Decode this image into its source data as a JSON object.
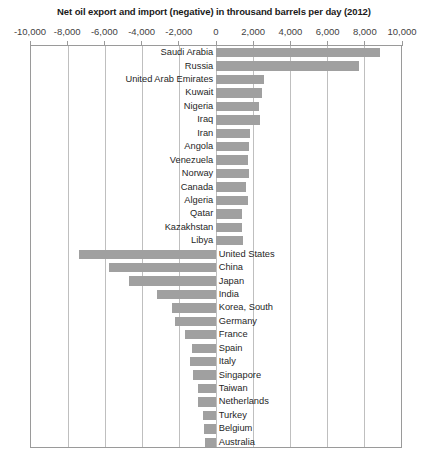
{
  "chart_data": {
    "type": "bar",
    "orientation": "horizontal",
    "title": "Net oil export and import (negative) in throusand barrels per day (2012)",
    "xlabel": "",
    "ylabel": "",
    "xlim": [
      -10000,
      10000
    ],
    "xticks": [
      -10000,
      -8000,
      -6000,
      -4000,
      -2000,
      0,
      2000,
      4000,
      6000,
      8000,
      10000
    ],
    "xticklabels": [
      "-10,000",
      "-8,000",
      "-6,000",
      "-4,000",
      "-2,000",
      "0",
      "2,000",
      "4,000",
      "6,000",
      "8,000",
      "10,000"
    ],
    "grid": true,
    "legend": false,
    "bar_color": "#a0a0a0",
    "categories": [
      "Saudi Arabia",
      "Russia",
      "United Arab Emirates",
      "Kuwait",
      "Nigeria",
      "Iraq",
      "Iran",
      "Angola",
      "Venezuela",
      "Norway",
      "Canada",
      "Algeria",
      "Qatar",
      "Kazakhstan",
      "Libya",
      "United States",
      "China",
      "Japan",
      "India",
      "Korea, South",
      "Germany",
      "France",
      "Spain",
      "Italy",
      "Singapore",
      "Taiwan",
      "Netherlands",
      "Turkey",
      "Belgium",
      "Australia"
    ],
    "values": [
      8850,
      7750,
      2600,
      2480,
      2340,
      2400,
      1860,
      1780,
      1740,
      1800,
      1600,
      1740,
      1430,
      1390,
      1440,
      -7400,
      -5800,
      -4700,
      -3200,
      -2400,
      -2200,
      -1700,
      -1300,
      -1400,
      -1250,
      -1000,
      -950,
      -700,
      -650,
      -600
    ]
  }
}
